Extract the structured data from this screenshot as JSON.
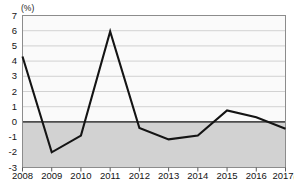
{
  "chart_data": {
    "type": "line",
    "title": "",
    "xlabel": "(年)",
    "ylabel": "(%)",
    "categories": [
      "2008",
      "2009",
      "2010",
      "2011",
      "2012",
      "2013",
      "2014",
      "2015",
      "2016",
      "2017"
    ],
    "values": [
      4.3,
      -2.0,
      -0.9,
      5.95,
      -0.4,
      -1.15,
      -0.9,
      0.75,
      0.3,
      -0.45
    ],
    "series": [
      {
        "name": "",
        "values": [
          4.3,
          -2.0,
          -0.9,
          5.95,
          -0.4,
          -1.15,
          -0.9,
          0.75,
          0.3,
          -0.45
        ]
      }
    ],
    "ylim": [
      -3,
      7
    ],
    "ytick_step": 1,
    "yticks": [
      7,
      6,
      5,
      4,
      3,
      2,
      1,
      0,
      -1,
      -2,
      -3
    ],
    "xlim": [
      "2008",
      "2017"
    ],
    "grid": true,
    "legend": "none",
    "zero_line": 0,
    "negative_region_shaded": true
  },
  "axes": {
    "y_unit_label": "(%)",
    "x_unit_suffix": "(年)"
  },
  "colors": {
    "line": "#141414",
    "grid": "#c8c8c8",
    "zero_line": "#4d4d4d",
    "negative_fill": "#d2d2d2",
    "plot_background": "#fafafa",
    "plot_border": "#8c8c8c",
    "text": "#141414"
  },
  "ghost": {
    "top_text": "",
    "bottom_text": ""
  }
}
